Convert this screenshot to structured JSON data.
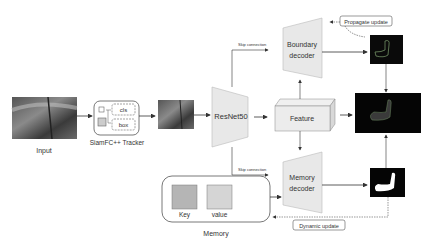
{
  "diagram": {
    "input": {
      "label": "Input"
    },
    "tracker": {
      "label": "SiamFC++ Tracker",
      "cls": "cls",
      "box": "box"
    },
    "backbone": {
      "label": "ResNet50"
    },
    "feature": {
      "label": "Feature"
    },
    "boundary_decoder": {
      "line1": "Boundary",
      "line2": "decoder"
    },
    "memory_decoder": {
      "line1": "Memory",
      "line2": "decoder"
    },
    "memory": {
      "label": "Memory",
      "key": "Key",
      "value": "value"
    },
    "skip_top": "Skip connection",
    "skip_bottom": "Skip connection",
    "propagate": "Propagate update",
    "dynamic": "Dynamic update"
  }
}
